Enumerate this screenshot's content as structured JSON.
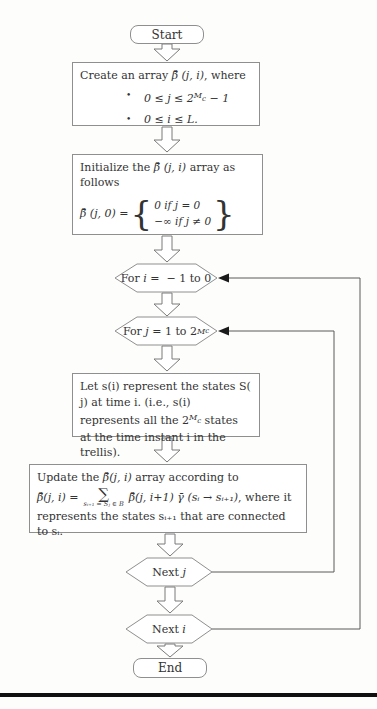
{
  "colors": {
    "background": "#fdfdfb",
    "box_border": "#8f8f8f",
    "text": "#333333",
    "connector_line": "#5a5a5a",
    "solid_arrowhead": "#1a1a1a",
    "bottom_rule": "#101010"
  },
  "flow": {
    "start": {
      "label": "Start"
    },
    "create_box": {
      "title_pre": "Create an array ",
      "title_math": "β̄ (j, i)",
      "title_post": ", where",
      "bullet_glyph": "•",
      "b1_pre": "0 ≤ j ≤ 2",
      "b1_sup": "M",
      "b1_supsub": "c",
      "b1_post": " − 1",
      "b2": "0 ≤ i ≤ L."
    },
    "init_box": {
      "title_pre": "Initialize the ",
      "title_math": "β̄ (j, i)",
      "title_post": " array as follows",
      "eq_lhs": "β̄ (j, 0) = ",
      "brace_left": "{",
      "case1": "0 if j = 0",
      "case2": "−∞ if j ≠ 0",
      "brace_right": "}"
    },
    "loop_i": {
      "pre": "For ",
      "var": "i",
      "post": " =  − 1 to 0"
    },
    "loop_j": {
      "pre": "For ",
      "var": "j",
      "post": " = 1 to 2",
      "sup": "M",
      "supsub": "c"
    },
    "states_box": {
      "p1": "Let s(i) represent the states S( j) at time i. (i.e., s(i) represents all the 2",
      "sup": "M",
      "supsub": "c",
      "p2": " states at the time instant i in the trellis)."
    },
    "update_box": {
      "title_pre": "Update the ",
      "title_math": "β̄(j, i)",
      "title_post": " array according to",
      "eq_lhs": "β̄(j, i) = ",
      "sigma": "∑",
      "sigma_sub": "sᵢ₊₁ = Sⱼ ∈ B",
      "eq_rhs_math": "β̄(j, i+1) γ̄ (sᵢ → sᵢ₊₁)",
      "eq_rhs_tail": ", where it",
      "tail": "represents the states sᵢ₊₁ that are connected to sᵢ."
    },
    "next_j": {
      "pre": "Next ",
      "var": "j"
    },
    "next_i": {
      "pre": "Next ",
      "var": "i"
    },
    "end": {
      "label": "End"
    }
  }
}
